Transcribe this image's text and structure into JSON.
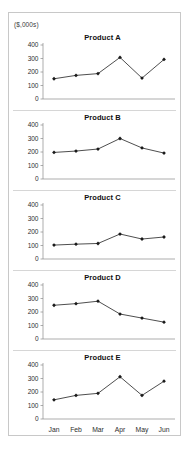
{
  "panel": {
    "units_caption": "($,000s)"
  },
  "chart_data": {
    "type": "line",
    "title": "",
    "xlabel": "",
    "ylabel": "($,000s)",
    "ylim": [
      0,
      400
    ],
    "yticks": [
      0,
      100,
      200,
      300,
      400
    ],
    "ytick_labels": [
      "0",
      "100",
      "200",
      "300",
      "400"
    ],
    "grid": false,
    "legend": "none",
    "layout": "small-multiples-vertical",
    "categories": [
      "Jan",
      "Feb",
      "Mar",
      "Apr",
      "May",
      "Jun"
    ],
    "series": [
      {
        "name": "Product A",
        "values": [
          150,
          175,
          188,
          308,
          155,
          293
        ]
      },
      {
        "name": "Product B",
        "values": [
          197,
          207,
          222,
          300,
          230,
          192
        ]
      },
      {
        "name": "Product C",
        "values": [
          103,
          110,
          115,
          185,
          148,
          163
        ]
      },
      {
        "name": "Product D",
        "values": [
          250,
          262,
          280,
          185,
          155,
          125
        ]
      },
      {
        "name": "Product E",
        "values": [
          142,
          175,
          190,
          313,
          175,
          280
        ]
      }
    ],
    "colors": {
      "line": "#3a3a3a",
      "marker": "#1a1a1a",
      "axis": "#8a8a8a",
      "text": "#2e2e2e",
      "border": "#c8c8c8"
    }
  }
}
